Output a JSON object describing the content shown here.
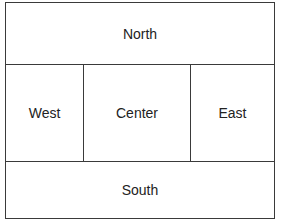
{
  "layout": {
    "regions": {
      "north": "North",
      "west": "West",
      "center": "Center",
      "east": "East",
      "south": "South"
    }
  },
  "colors": {
    "border": "#3a3a3a",
    "text": "#222222",
    "background": "#ffffff"
  }
}
